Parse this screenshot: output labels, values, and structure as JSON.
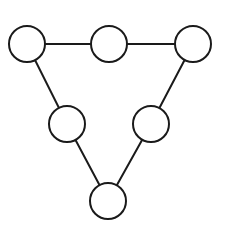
{
  "diagram": {
    "type": "graph",
    "canvas": {
      "width": 227,
      "height": 229
    },
    "style": {
      "stroke_color": "#1a1a1a",
      "fill_color": "#ffffff",
      "background": "#ffffff",
      "node_radius": 18
    },
    "nodes": [
      {
        "id": "n1",
        "label": "",
        "position": "top-left",
        "x": 27,
        "y": 44
      },
      {
        "id": "n2",
        "label": "",
        "position": "top-middle",
        "x": 109,
        "y": 44
      },
      {
        "id": "n3",
        "label": "",
        "position": "top-right",
        "x": 193,
        "y": 44
      },
      {
        "id": "n4",
        "label": "",
        "position": "middle-left",
        "x": 67,
        "y": 124
      },
      {
        "id": "n5",
        "label": "",
        "position": "middle-right",
        "x": 151,
        "y": 124
      },
      {
        "id": "n6",
        "label": "",
        "position": "bottom",
        "x": 108,
        "y": 201
      }
    ],
    "edges": [
      {
        "from": "n1",
        "to": "n2"
      },
      {
        "from": "n2",
        "to": "n3"
      },
      {
        "from": "n1",
        "to": "n4"
      },
      {
        "from": "n4",
        "to": "n6"
      },
      {
        "from": "n3",
        "to": "n5"
      },
      {
        "from": "n5",
        "to": "n6"
      }
    ]
  }
}
